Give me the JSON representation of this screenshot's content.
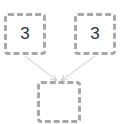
{
  "diagram": {
    "nodes": [
      {
        "id": "left",
        "label": "3"
      },
      {
        "id": "right",
        "label": "3"
      },
      {
        "id": "bottom",
        "label": ""
      }
    ],
    "edges": [
      {
        "from": "left",
        "to": "bottom"
      },
      {
        "from": "right",
        "to": "bottom"
      }
    ],
    "colors": {
      "border": "#a8a8a8",
      "arrow": "#cccccc",
      "text": "#333333"
    }
  }
}
